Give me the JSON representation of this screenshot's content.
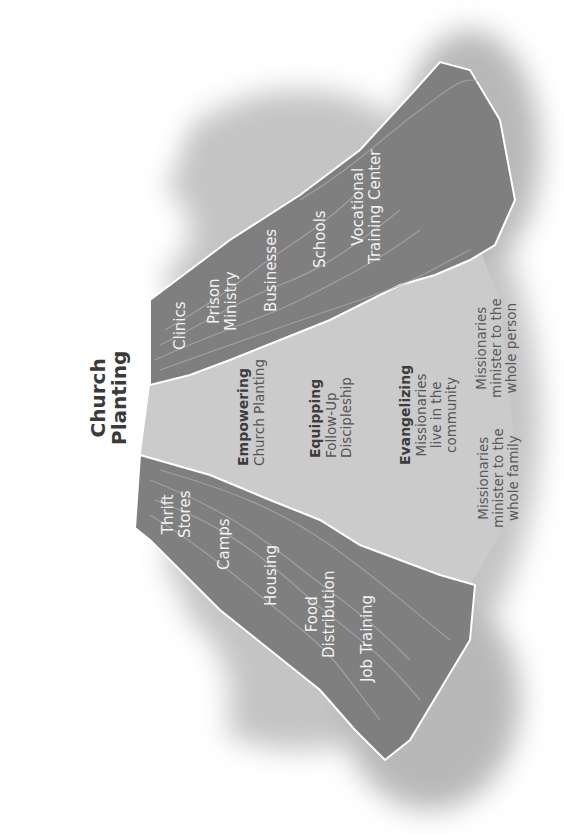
{
  "title": {
    "line1": "Church",
    "line2": "Planting"
  },
  "stages": [
    {
      "heading": "Empowering",
      "lines": [
        "Church Planting"
      ]
    },
    {
      "heading": "Equipping",
      "lines": [
        "Follow-Up",
        "Discipleship"
      ]
    },
    {
      "heading": "Evangelizing",
      "lines": [
        "Missionaries",
        "live in the",
        "community"
      ]
    }
  ],
  "notes": {
    "family": [
      "Missionaries",
      "minister to the",
      "whole family"
    ],
    "person": [
      "Missionaries",
      "minister to the",
      "whole person"
    ]
  },
  "upper_wedge": {
    "items": [
      {
        "lines": [
          "Clinics"
        ]
      },
      {
        "lines": [
          "Prison",
          "Ministry"
        ]
      },
      {
        "lines": [
          "Businesses"
        ]
      },
      {
        "lines": [
          "Schools"
        ]
      },
      {
        "lines": [
          "Vocational",
          "Training Center"
        ]
      }
    ]
  },
  "lower_wedge": {
    "items": [
      {
        "lines": [
          "Thrift",
          "Stores"
        ]
      },
      {
        "lines": [
          "Camps"
        ]
      },
      {
        "lines": [
          "Housing"
        ]
      },
      {
        "lines": [
          "Food",
          "Distribution"
        ]
      },
      {
        "lines": [
          "Job Training"
        ]
      }
    ]
  },
  "colors": {
    "wedge": "#7d7d7d",
    "center": "#c9c9c9",
    "halo": "#bdbdbd",
    "edge": "#ffffff"
  }
}
